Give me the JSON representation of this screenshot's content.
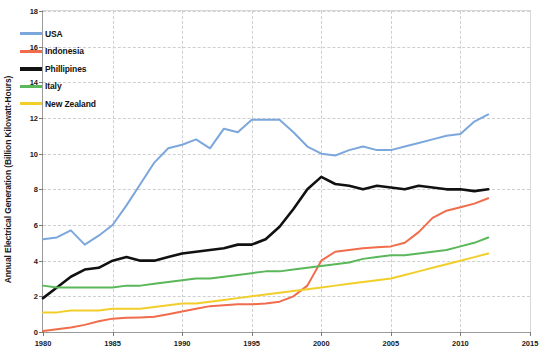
{
  "chart_data": {
    "type": "line",
    "title": "",
    "subtitle": "",
    "xlabel": "",
    "ylabel": "Annual Electrical Generation (Billion Kilowatt-Hours)",
    "xlim": [
      1980,
      2015
    ],
    "ylim": [
      0,
      18
    ],
    "xticks": [
      1980,
      1985,
      1990,
      1995,
      2000,
      2005,
      2010,
      2015
    ],
    "xtick_labels": [
      "1980",
      "1985",
      "1990",
      "1995",
      "2000",
      "2005",
      "2010",
      "2015"
    ],
    "yticks": [
      0,
      2,
      4,
      6,
      8,
      10,
      12,
      14,
      16,
      18
    ],
    "ytick_labels": [
      "0",
      "2",
      "4",
      "6",
      "8",
      "10",
      "12",
      "14",
      "16",
      "18"
    ],
    "grid": true,
    "grid_style": "dashed",
    "legend_position": "upper-left",
    "x": [
      1980,
      1981,
      1982,
      1983,
      1984,
      1985,
      1986,
      1987,
      1988,
      1989,
      1990,
      1991,
      1992,
      1993,
      1994,
      1995,
      1996,
      1997,
      1998,
      1999,
      2000,
      2001,
      2002,
      2003,
      2004,
      2005,
      2006,
      2007,
      2008,
      2009,
      2010,
      2011,
      2012
    ],
    "series": [
      {
        "name": "USA",
        "color": "#7BA7DD",
        "width": 2.0,
        "values": [
          5.2,
          5.3,
          5.7,
          4.9,
          5.4,
          6.0,
          7.1,
          8.3,
          9.5,
          10.3,
          10.5,
          10.8,
          10.3,
          11.4,
          11.2,
          11.9,
          11.9,
          11.9,
          11.2,
          10.4,
          10.0,
          9.9,
          10.2,
          10.4,
          10.2,
          10.2,
          10.4,
          10.6,
          10.8,
          11.0,
          11.1,
          11.8,
          12.2
        ]
      },
      {
        "name": "Indonesia",
        "color": "#F06C4B",
        "width": 2.0,
        "values": [
          0.05,
          0.15,
          0.25,
          0.4,
          0.6,
          0.75,
          0.8,
          0.82,
          0.85,
          1.0,
          1.15,
          1.3,
          1.45,
          1.5,
          1.55,
          1.55,
          1.6,
          1.7,
          2.0,
          2.6,
          4.0,
          4.5,
          4.6,
          4.7,
          4.75,
          4.8,
          5.0,
          5.6,
          6.4,
          6.8,
          7.0,
          7.2,
          7.5
        ]
      },
      {
        "name": "Phillipines",
        "color": "#111111",
        "width": 2.6,
        "values": [
          1.9,
          2.5,
          3.1,
          3.5,
          3.6,
          4.0,
          4.2,
          4.0,
          4.0,
          4.2,
          4.4,
          4.5,
          4.6,
          4.7,
          4.9,
          4.9,
          5.2,
          5.9,
          6.9,
          8.0,
          8.7,
          8.3,
          8.2,
          8.0,
          8.2,
          8.1,
          8.0,
          8.2,
          8.1,
          8.0,
          8.0,
          7.9,
          8.0
        ]
      },
      {
        "name": "Italy",
        "color": "#5AB75A",
        "width": 2.0,
        "values": [
          2.6,
          2.5,
          2.5,
          2.5,
          2.5,
          2.5,
          2.6,
          2.6,
          2.7,
          2.8,
          2.9,
          3.0,
          3.0,
          3.1,
          3.2,
          3.3,
          3.4,
          3.4,
          3.5,
          3.6,
          3.7,
          3.8,
          3.9,
          4.1,
          4.2,
          4.3,
          4.3,
          4.4,
          4.5,
          4.6,
          4.8,
          5.0,
          5.3
        ]
      },
      {
        "name": "New Zealand",
        "color": "#F2CE2B",
        "width": 2.0,
        "values": [
          1.1,
          1.1,
          1.2,
          1.2,
          1.2,
          1.3,
          1.3,
          1.3,
          1.4,
          1.5,
          1.6,
          1.6,
          1.7,
          1.8,
          1.9,
          2.0,
          2.1,
          2.2,
          2.3,
          2.4,
          2.5,
          2.6,
          2.7,
          2.8,
          2.9,
          3.0,
          3.2,
          3.4,
          3.6,
          3.8,
          4.0,
          4.2,
          4.4
        ]
      }
    ]
  },
  "legend": {
    "entries": [
      {
        "label": "USA",
        "color": "#7BA7DD"
      },
      {
        "label": "Indonesia",
        "color": "#F06C4B"
      },
      {
        "label": "Phillipines",
        "color": "#111111"
      },
      {
        "label": "Italy",
        "color": "#5AB75A"
      },
      {
        "label": "New Zealand",
        "color": "#F2CE2B"
      }
    ]
  }
}
